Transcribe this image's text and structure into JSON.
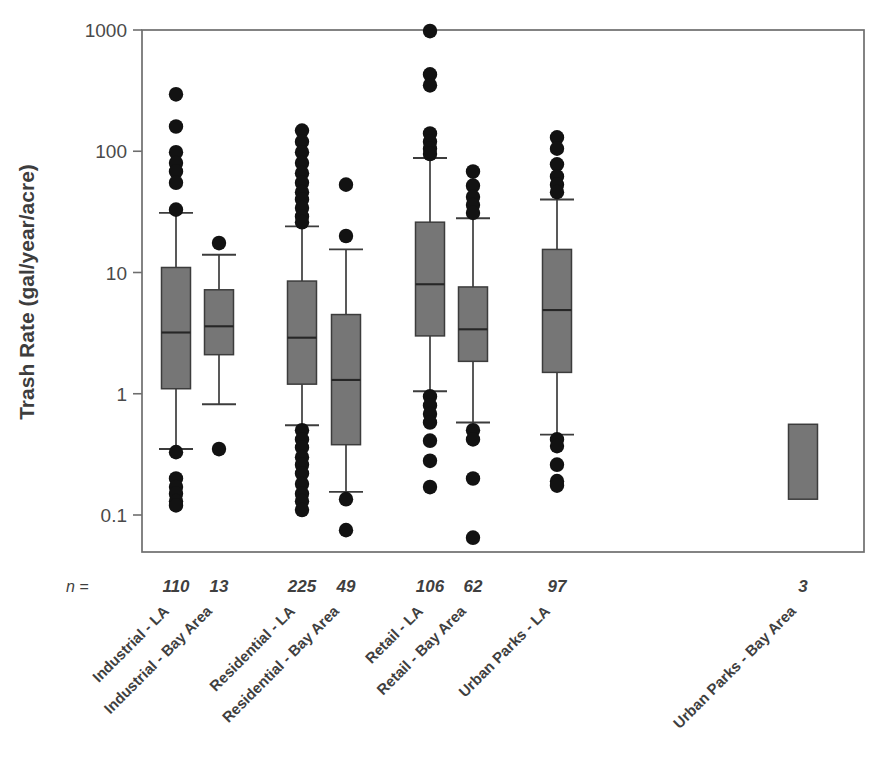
{
  "figure": {
    "background_color": "#ffffff",
    "plot_frame_color": "#6e6e6e",
    "box_fill_color": "#767676",
    "box_edge_color": "#3c3c3c",
    "marker_color": "#121212"
  },
  "axes": {
    "y_title": "Trash Rate (gal/year/acre)",
    "y_scale": "log",
    "y_ticks": [
      "1000",
      "100",
      "10",
      "1",
      "0.1"
    ],
    "y_tick_values": [
      1000,
      100,
      10,
      1,
      0.1
    ],
    "ylim": [
      0.1,
      1000
    ],
    "n_prefix": "n ="
  },
  "chart_data": {
    "type": "box",
    "title": "",
    "xlabel": "",
    "ylabel": "Trash Rate (gal/year/acre)",
    "ylim": [
      0.1,
      1000
    ],
    "yscale": "log",
    "grid": false,
    "legend": "none",
    "categories": [
      "Industrial - LA",
      "Industrial - Bay Area",
      "Residential - LA",
      "Residential - Bay Area",
      "Retail - LA",
      "Retail - Bay Area",
      "Urban Parks - LA",
      "Urban Parks - Bay Area"
    ],
    "n": [
      110,
      13,
      225,
      49,
      106,
      62,
      97,
      3
    ],
    "boxes": [
      {
        "label": "Industrial - LA",
        "n": 110,
        "whisker_low": 0.35,
        "q1": 1.1,
        "median": 3.2,
        "q3": 11.0,
        "whisker_high": 31.0,
        "outliers_high": [
          295,
          160,
          98,
          80,
          68,
          55,
          33
        ],
        "outliers_low": [
          0.33,
          0.2,
          0.17,
          0.15,
          0.13,
          0.12
        ]
      },
      {
        "label": "Industrial - Bay Area",
        "n": 13,
        "whisker_low": 0.82,
        "q1": 2.1,
        "median": 3.6,
        "q3": 7.2,
        "whisker_high": 14.0,
        "outliers_high": [
          17.5
        ],
        "outliers_low": [
          0.35
        ]
      },
      {
        "label": "Residential - LA",
        "n": 225,
        "whisker_low": 0.55,
        "q1": 1.2,
        "median": 2.9,
        "q3": 8.5,
        "whisker_high": 24.0,
        "outliers_high": [
          148,
          120,
          98,
          80,
          66,
          55,
          46,
          40,
          34,
          29,
          26
        ],
        "outliers_low": [
          0.5,
          0.42,
          0.36,
          0.3,
          0.26,
          0.22,
          0.18,
          0.15,
          0.13,
          0.11
        ]
      },
      {
        "label": "Residential - Bay Area",
        "n": 49,
        "whisker_low": 0.155,
        "q1": 0.38,
        "median": 1.3,
        "q3": 4.5,
        "whisker_high": 15.5,
        "outliers_high": [
          53,
          20
        ],
        "outliers_low": [
          0.135,
          0.075
        ]
      },
      {
        "label": "Retail - LA",
        "n": 106,
        "whisker_low": 1.05,
        "q1": 3.0,
        "median": 8.0,
        "q3": 26.0,
        "whisker_high": 88.0,
        "outliers_high": [
          980,
          430,
          350,
          140,
          120,
          105,
          95
        ],
        "outliers_low": [
          0.95,
          0.8,
          0.68,
          0.58,
          0.41,
          0.28,
          0.17
        ]
      },
      {
        "label": "Retail - Bay Area",
        "n": 62,
        "whisker_low": 0.58,
        "q1": 1.85,
        "median": 3.4,
        "q3": 7.6,
        "whisker_high": 28.0,
        "outliers_high": [
          68,
          52,
          42,
          36,
          31
        ],
        "outliers_low": [
          0.5,
          0.42,
          0.2,
          0.065
        ]
      },
      {
        "label": "Urban Parks - LA",
        "n": 97,
        "whisker_low": 0.46,
        "q1": 1.5,
        "median": 4.9,
        "q3": 15.5,
        "whisker_high": 40.0,
        "outliers_high": [
          130,
          105,
          78,
          62,
          53,
          46
        ],
        "outliers_low": [
          0.42,
          0.37,
          0.26,
          0.19,
          0.175
        ]
      },
      {
        "label": "Urban Parks - Bay Area",
        "n": 3,
        "whisker_low": null,
        "q1": 0.135,
        "median": null,
        "q3": 0.56,
        "whisker_high": null,
        "outliers_high": [],
        "outliers_low": []
      }
    ]
  }
}
